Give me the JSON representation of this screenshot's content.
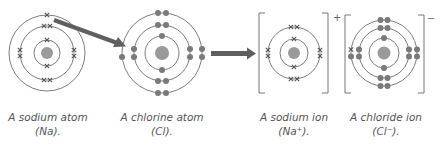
{
  "colors": {
    "shell": "#6e6e6e",
    "nucleus": "#9a9a9a",
    "electron_dot": "#7a7a7a",
    "electron_cross": "#555555",
    "arrow": "#5f5f5f",
    "bracket": "#777777",
    "caption": "#555555"
  },
  "panels": [
    {
      "id": "sodium-atom",
      "caption_line1": "A sodium atom",
      "caption_line2": "(Na).",
      "electron_symbol": "cross",
      "shells": [
        2,
        8,
        1
      ]
    },
    {
      "id": "chlorine-atom",
      "caption_line1": "A chlorine atom",
      "caption_line2": "(Cl).",
      "electron_symbol": "dot",
      "shells": [
        2,
        8,
        7
      ]
    },
    {
      "id": "sodium-ion",
      "caption_line1": "A sodium ion",
      "caption_line2": "(Na⁺).",
      "electron_symbol": "cross",
      "shells": [
        2,
        8
      ],
      "charge": "+"
    },
    {
      "id": "chloride-ion",
      "caption_line1": "A chloride ion",
      "caption_line2": "(Cl⁻).",
      "electron_symbol": "dot",
      "shells": [
        2,
        8,
        8
      ],
      "transferred_electron": "cross",
      "charge": "−"
    }
  ],
  "arrows": [
    {
      "id": "electron-transfer-arrow",
      "meaning": "electron moves from sodium outer shell to chlorine outer shell"
    },
    {
      "id": "reaction-arrow",
      "meaning": "atoms become ions"
    }
  ]
}
